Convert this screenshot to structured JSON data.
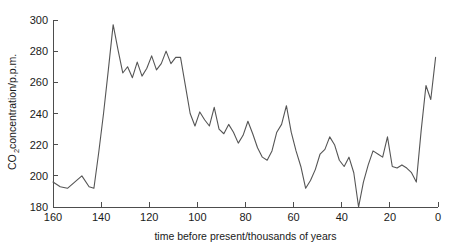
{
  "chart_data": {
    "type": "line",
    "title": "",
    "xlabel": "time before present/thousands of years",
    "ylabel_main": "CO",
    "ylabel_sub": "2",
    "ylabel_rest": " concentration/p.p.m.",
    "ylabel_full": "CO2 concentration/p.p.m.",
    "xlim": [
      160,
      0
    ],
    "ylim": [
      180,
      300
    ],
    "x_reversed": true,
    "grid": false,
    "legend": "none",
    "xticks": [
      160,
      140,
      120,
      100,
      80,
      60,
      40,
      20,
      0
    ],
    "xtick_labels": [
      "160",
      "140",
      "120",
      "100",
      "80",
      "60",
      "40",
      "20",
      "0"
    ],
    "yticks": [
      180,
      200,
      220,
      240,
      260,
      280,
      300
    ],
    "ytick_labels": [
      "180",
      "200",
      "220",
      "240",
      "260",
      "280",
      "300"
    ],
    "line_color": "#555555",
    "axis_color": "#4d4d4d",
    "background_color": "#ffffff",
    "series": [
      {
        "name": "CO2 concentration",
        "x": [
          160,
          157,
          154,
          151,
          148,
          145,
          143,
          141,
          139,
          137,
          135,
          133,
          131,
          129,
          127,
          125,
          123,
          121,
          119,
          117,
          115,
          113,
          111,
          109,
          107,
          105,
          103,
          101,
          99,
          97,
          95,
          93,
          91,
          89,
          87,
          85,
          83,
          81,
          79,
          77,
          75,
          73,
          71,
          69,
          67,
          65,
          63,
          61,
          59,
          57,
          55,
          53,
          51,
          49,
          47,
          45,
          43,
          41,
          39,
          37,
          35,
          33,
          31,
          29,
          27,
          25,
          23,
          21,
          19,
          17,
          15,
          13,
          11,
          9,
          7,
          5,
          3,
          1
        ],
        "y": [
          196,
          193,
          192,
          196,
          200,
          193,
          192,
          215,
          240,
          268,
          297,
          281,
          266,
          270,
          263,
          273,
          264,
          269,
          277,
          268,
          272,
          280,
          272,
          276,
          276,
          258,
          240,
          232,
          241,
          236,
          232,
          244,
          230,
          227,
          233,
          228,
          221,
          226,
          235,
          227,
          218,
          212,
          210,
          216,
          228,
          233,
          245,
          228,
          216,
          206,
          192,
          197,
          204,
          214,
          217,
          225,
          220,
          210,
          206,
          212,
          202,
          180,
          196,
          207,
          216,
          214,
          212,
          225,
          206,
          205,
          207,
          205,
          202,
          196,
          229,
          258,
          249,
          276
        ]
      }
    ]
  }
}
